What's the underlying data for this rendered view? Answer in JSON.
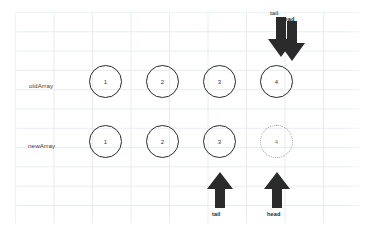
{
  "diagram": {
    "background_color": "#ffffff",
    "grid_color": "#dfe6ef",
    "ink_color": "#2b2b2b",
    "ghost_color": "#9a9a9a"
  },
  "rows": [
    {
      "id": "oldArray",
      "label": "oldArray",
      "nodes": [
        {
          "value": "1",
          "style": "solid"
        },
        {
          "value": "2",
          "style": "solid"
        },
        {
          "value": "3",
          "style": "solid"
        },
        {
          "value": "4",
          "style": "solid"
        }
      ]
    },
    {
      "id": "newArray",
      "label": "newArray",
      "nodes": [
        {
          "value": "1",
          "style": "solid"
        },
        {
          "value": "2",
          "style": "solid"
        },
        {
          "value": "3",
          "style": "solid"
        },
        {
          "value": "4",
          "style": "dotted"
        }
      ]
    }
  ],
  "pointers": {
    "top": [
      {
        "id": "tail-top",
        "label": "tail",
        "direction": "down",
        "target_index": 3
      },
      {
        "id": "head-top",
        "label": "head",
        "direction": "down",
        "target_index": 3
      }
    ],
    "bottom": [
      {
        "id": "tail-bottom",
        "label": "tail",
        "direction": "up",
        "target_index": 2
      },
      {
        "id": "head-bottom",
        "label": "head",
        "direction": "up",
        "target_index": 3
      }
    ]
  }
}
